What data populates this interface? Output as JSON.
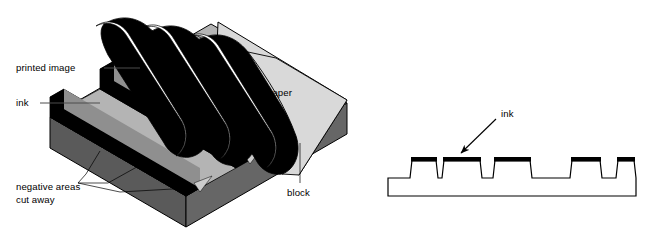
{
  "figure": {
    "title": "Relief printing: inked block transferring a printed image to paper",
    "background_color": "#ffffff"
  },
  "labels": {
    "printed_image": "printed image",
    "ink_left": "ink",
    "negative_areas_line1": "negative areas",
    "negative_areas_line2": "cut away",
    "paper": "paper",
    "block": "block",
    "ink_right": "ink"
  },
  "colors": {
    "ink_black": "#000000",
    "paper_light": "#d9d9d9",
    "paper_top": "#dcdcdc",
    "block_side_dark": "#5a5a5a",
    "block_side_mid": "#6e6e6e",
    "groove_floor": "#b4b4b4",
    "groove_floor_shadow": "#8f8f8f",
    "outline": "#000000",
    "leader_grey": "#4c4c4c",
    "page_background": "#ffffff"
  },
  "left_diagram": {
    "name": "isometric-relief-block",
    "description": "Three-quarter view of a carved printing block with three inked raised ridges, grooves cut away between them, and a sheet of paper peeling back off the block showing black printed stripes.",
    "ridge_count": 3,
    "printed_stripe_count": 3,
    "parts": [
      "printed image",
      "ink",
      "negative areas cut away",
      "paper",
      "block"
    ]
  },
  "right_diagram": {
    "name": "block-cross-section",
    "description": "Side cross-section profile of the printing block showing five raised ridges each capped with a thick black ink layer, separated by cut-away recesses.",
    "ridge_count": 5,
    "ink_cap_color": "#000000",
    "body_fill": "#ffffff",
    "profile_points": "Baseline at y=178; slab bottom y=196; ridge tops y=158",
    "ridges": [
      {
        "index": 1,
        "left": 414,
        "right": 434,
        "top": 158
      },
      {
        "index": 2,
        "left": 444,
        "right": 478,
        "top": 158
      },
      {
        "index": 3,
        "left": 497,
        "right": 528,
        "top": 158
      },
      {
        "index": 4,
        "left": 572,
        "right": 598,
        "top": 158
      },
      {
        "index": 5,
        "left": 619,
        "right": 632,
        "top": 158
      }
    ],
    "arrow": {
      "from_x": 495,
      "from_y": 120,
      "to_x": 459,
      "to_y": 155,
      "label": "ink"
    }
  }
}
